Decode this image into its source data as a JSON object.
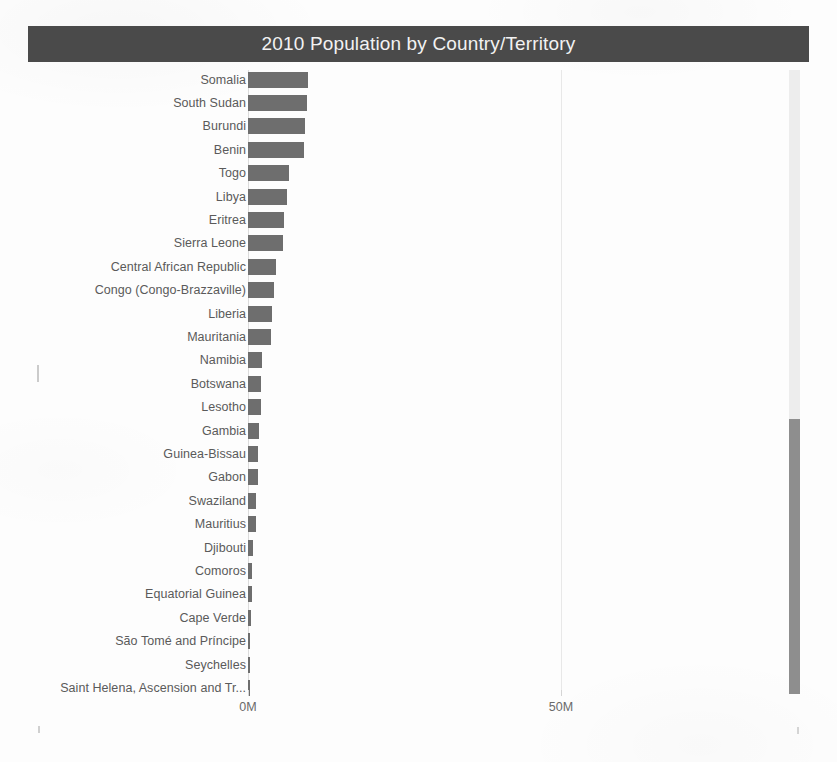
{
  "visual": {
    "title": "2010 Population by Country/Territory"
  },
  "scrollbar": {
    "name": "vertical-scrollbar",
    "thumb_top_px": 349,
    "thumb_height_px": 275
  },
  "colors": {
    "title_bar": "#4a4a4a",
    "title_text": "#f2f2f2",
    "bar": "#6e6e6e",
    "gridline": "#e8e8e8",
    "label_text": "#5a5a5a",
    "axis_text": "#6a6a6a",
    "scroll_track": "#ededed",
    "scroll_thumb": "#8e8e8e",
    "background": "#fdfdfd"
  },
  "chart_data": {
    "type": "bar",
    "orientation": "horizontal",
    "title": "2010 Population by Country/Territory",
    "xlabel": "",
    "ylabel": "",
    "xlim": [
      0,
      210
    ],
    "unit": "millions",
    "tick_labels": [
      "0M",
      "50M",
      "100M",
      "150M",
      "200M"
    ],
    "tick_values": [
      0,
      50,
      100,
      150,
      200
    ],
    "grid": true,
    "legend": null,
    "sort": "descending",
    "categories": [
      "Somalia",
      "South Sudan",
      "Burundi",
      "Benin",
      "Togo",
      "Libya",
      "Eritrea",
      "Sierra Leone",
      "Central African Republic",
      "Congo (Congo-Brazzaville)",
      "Liberia",
      "Mauritania",
      "Namibia",
      "Botswana",
      "Lesotho",
      "Gambia",
      "Guinea-Bissau",
      "Gabon",
      "Swaziland",
      "Mauritius",
      "Djibouti",
      "Comoros",
      "Equatorial Guinea",
      "Cape Verde",
      "São Tomé and Príncipe",
      "Seychelles",
      "Saint Helena, Ascension and Tr..."
    ],
    "values": [
      9.6,
      9.4,
      9.1,
      9.0,
      6.6,
      6.2,
      5.7,
      5.6,
      4.4,
      4.2,
      3.9,
      3.6,
      2.2,
      2.0,
      2.0,
      1.7,
      1.6,
      1.6,
      1.2,
      1.2,
      0.85,
      0.7,
      0.7,
      0.5,
      0.19,
      0.09,
      0.05
    ]
  }
}
